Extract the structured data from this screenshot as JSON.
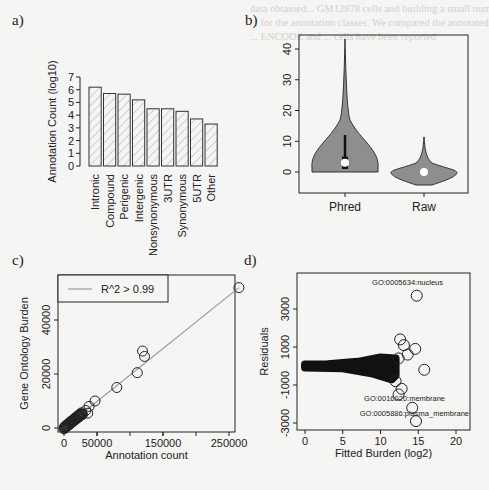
{
  "panels": {
    "a": {
      "label": "a)"
    },
    "b": {
      "label": "b)"
    },
    "c": {
      "label": "c)"
    },
    "d": {
      "label": "d)"
    }
  },
  "chart_data": [
    {
      "panel": "a",
      "type": "bar",
      "title": "",
      "xlabel": "",
      "ylabel": "Annotation Count (log10)",
      "categories": [
        "Intronic",
        "Compound",
        "Perigenic",
        "Intergenic",
        "Nonsynonymous",
        "3UTR",
        "Synonymous",
        "5UTR",
        "Other"
      ],
      "values": [
        6.2,
        5.7,
        5.65,
        5.2,
        4.5,
        4.5,
        4.3,
        3.7,
        3.3
      ],
      "yticks": [
        0,
        1,
        2,
        3,
        4,
        5,
        6,
        7
      ],
      "ylim": [
        0,
        7
      ],
      "style": "hatched bars",
      "grid": false
    },
    {
      "panel": "b",
      "type": "violin",
      "title": "",
      "xlabel": "",
      "ylabel": "",
      "categories": [
        "Phred",
        "Raw"
      ],
      "series": [
        {
          "name": "Phred",
          "min": 0,
          "max": 43,
          "median": 3,
          "q1": 1,
          "q3": 5,
          "whisker_high": 12
        },
        {
          "name": "Raw",
          "min": -5,
          "max": 14,
          "median": 0
        }
      ],
      "yticks": [
        0,
        10,
        20,
        30,
        40
      ],
      "ylim": [
        -6,
        46
      ],
      "grid": false
    },
    {
      "panel": "c",
      "type": "scatter",
      "title": "",
      "xlabel": "Annotation count",
      "ylabel": "Gene Ontology Burden",
      "xticks": [
        0,
        50000,
        150000,
        250000
      ],
      "yticks": [
        0,
        20000,
        40000
      ],
      "xlim": [
        -5000,
        270000
      ],
      "ylim": [
        -1000,
        54000
      ],
      "legend": {
        "position": "top-left",
        "entries": [
          "R^2 > 0.99"
        ]
      },
      "fit_line": {
        "slope": 0.2,
        "intercept": 0
      },
      "points": [
        [
          265000,
          52000
        ],
        [
          119000,
          28500
        ],
        [
          122000,
          26500
        ],
        [
          111000,
          20500
        ],
        [
          80000,
          15000
        ],
        [
          47000,
          10000
        ],
        [
          38000,
          8000
        ],
        [
          33000,
          6500
        ],
        [
          36000,
          5500
        ],
        [
          28000,
          5000
        ],
        [
          22000,
          4000
        ],
        [
          18000,
          3200
        ],
        [
          12000,
          2200
        ],
        [
          8000,
          1500
        ],
        [
          4000,
          800
        ],
        [
          2000,
          400
        ],
        [
          500,
          100
        ]
      ],
      "grid": false
    },
    {
      "panel": "d",
      "type": "scatter",
      "title": "",
      "xlabel": "Fitted Burden (log2)",
      "ylabel": "Residuals",
      "xticks": [
        0,
        5,
        10,
        15,
        20
      ],
      "yticks": [
        -3000,
        -1000,
        1000,
        3000
      ],
      "xlim": [
        -1,
        22
      ],
      "ylim": [
        -3300,
        4000
      ],
      "annotations": [
        {
          "text": "GO:0005634:nucleus",
          "x": 14.8,
          "y": 3700
        },
        {
          "text": "GO:0016020:membrane",
          "x": 14.2,
          "y": -2200
        },
        {
          "text": "GO:0005886:plasma_membrane",
          "x": 14.7,
          "y": -2900
        }
      ],
      "outliers": [
        [
          14.8,
          3700
        ],
        [
          12.6,
          1400
        ],
        [
          13.1,
          1100
        ],
        [
          14.6,
          900
        ],
        [
          13.6,
          600
        ],
        [
          12.4,
          400
        ],
        [
          15.8,
          -200
        ],
        [
          12.0,
          -800
        ],
        [
          12.8,
          -1200
        ],
        [
          12.4,
          -1500
        ],
        [
          14.2,
          -2200
        ],
        [
          14.7,
          -2900
        ]
      ],
      "grid": false
    }
  ]
}
